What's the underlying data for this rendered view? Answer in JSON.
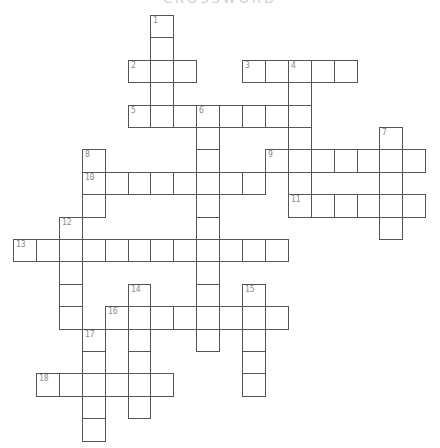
{
  "title": "CROSSWORD",
  "grid": {
    "origin_x": 13,
    "origin_y": 15,
    "cell_w": 22.9,
    "cell_h": 22.4,
    "border_color": "#555555",
    "number_color": "#888888"
  },
  "clues": [
    {
      "number": 1,
      "direction": "down",
      "row": 0,
      "col": 6,
      "length": 5
    },
    {
      "number": 2,
      "direction": "across",
      "row": 2,
      "col": 5,
      "length": 3
    },
    {
      "number": 3,
      "direction": "across",
      "row": 2,
      "col": 10,
      "length": 5
    },
    {
      "number": 4,
      "direction": "down",
      "row": 2,
      "col": 12,
      "length": 7
    },
    {
      "number": 5,
      "direction": "across",
      "row": 4,
      "col": 5,
      "length": 8
    },
    {
      "number": 6,
      "direction": "down",
      "row": 4,
      "col": 8,
      "length": 11
    },
    {
      "number": 7,
      "direction": "down",
      "row": 5,
      "col": 16,
      "length": 5
    },
    {
      "number": 8,
      "direction": "down",
      "row": 6,
      "col": 3,
      "length": 3
    },
    {
      "number": 9,
      "direction": "across",
      "row": 6,
      "col": 11,
      "length": 7
    },
    {
      "number": 10,
      "direction": "across",
      "row": 7,
      "col": 3,
      "length": 8
    },
    {
      "number": 11,
      "direction": "across",
      "row": 8,
      "col": 12,
      "length": 6
    },
    {
      "number": 12,
      "direction": "down",
      "row": 9,
      "col": 2,
      "length": 5
    },
    {
      "number": 13,
      "direction": "across",
      "row": 10,
      "col": 0,
      "length": 12
    },
    {
      "number": 14,
      "direction": "down",
      "row": 12,
      "col": 5,
      "length": 6
    },
    {
      "number": 15,
      "direction": "down",
      "row": 12,
      "col": 10,
      "length": 5
    },
    {
      "number": 16,
      "direction": "across",
      "row": 13,
      "col": 4,
      "length": 8
    },
    {
      "number": 17,
      "direction": "down",
      "row": 14,
      "col": 3,
      "length": 5
    },
    {
      "number": 18,
      "direction": "across",
      "row": 16,
      "col": 1,
      "length": 6
    }
  ]
}
